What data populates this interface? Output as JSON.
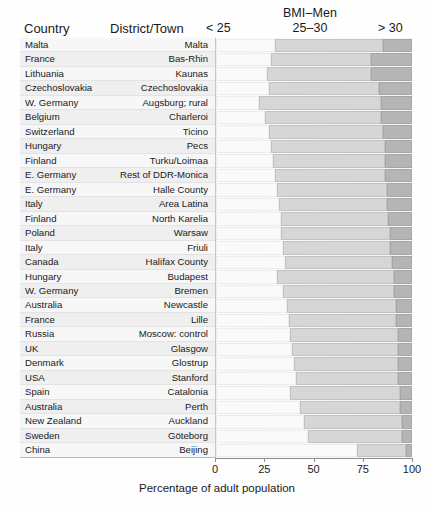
{
  "header": {
    "group_title": "BMI–Men",
    "col_country": "Country",
    "col_district": "District/Town",
    "cat_low": "< 25",
    "cat_mid": "25–30",
    "cat_high": "> 30"
  },
  "axis": {
    "xlabel": "Percentage of adult population",
    "ticks": [
      "0",
      "25",
      "50",
      "75",
      "100"
    ],
    "tick_values": [
      0,
      25,
      50,
      75,
      100
    ],
    "xlim": [
      0,
      100
    ]
  },
  "colors": {
    "low": "#fafafa",
    "mid": "#d6d6d6",
    "high": "#b5b5b5",
    "frame": "#b9b9b9",
    "axis": "#8d8d8d",
    "text": "#1a1a1a"
  },
  "chart_data": {
    "type": "bar",
    "orientation": "horizontal",
    "stacked": true,
    "title": "BMI–Men",
    "xlabel": "Percentage of adult population",
    "ylabel": "",
    "xlim": [
      0,
      100
    ],
    "grid": false,
    "legend_position": "top",
    "legend": [
      "< 25",
      "25–30",
      "> 30"
    ],
    "categories": [
      "Malta",
      "Bas-Rhin",
      "Kaunas",
      "Czechoslovakia",
      "Augsburg; rural",
      "Charleroi",
      "Ticino",
      "Pecs",
      "Turku/Loimaa",
      "Rest of DDR-Monica",
      "Halle County",
      "Area Latina",
      "North Karelia",
      "Warsaw",
      "Friuli",
      "Halifax County",
      "Budapest",
      "Bremen",
      "Newcastle",
      "Lille",
      "Moscow: control",
      "Glasgow",
      "Glostrup",
      "Stanford",
      "Catalonia",
      "Perth",
      "Auckland",
      "Göteborg",
      "Beijing"
    ],
    "series": [
      {
        "name": "< 25",
        "values": [
          30,
          28,
          26,
          27,
          22,
          25,
          27,
          28,
          29,
          30,
          31,
          32,
          33,
          33,
          34,
          35,
          31,
          34,
          36,
          37,
          38,
          39,
          40,
          41,
          38,
          43,
          45,
          47,
          72
        ]
      },
      {
        "name": "25–30",
        "values": [
          55,
          51,
          53,
          56,
          62,
          59,
          58,
          58,
          57,
          56,
          56,
          55,
          55,
          56,
          55,
          55,
          60,
          57,
          56,
          55,
          55,
          54,
          53,
          52,
          56,
          51,
          50,
          48,
          25
        ]
      },
      {
        "name": "> 30",
        "values": [
          15,
          21,
          21,
          17,
          16,
          16,
          15,
          14,
          14,
          14,
          13,
          13,
          12,
          11,
          11,
          10,
          9,
          9,
          8,
          8,
          7,
          7,
          7,
          7,
          6,
          6,
          5,
          5,
          3
        ]
      }
    ]
  },
  "rows": [
    {
      "country": "Malta",
      "district": "Malta",
      "low": 30,
      "mid": 55,
      "high": 15
    },
    {
      "country": "France",
      "district": "Bas-Rhin",
      "low": 28,
      "mid": 51,
      "high": 21
    },
    {
      "country": "Lithuania",
      "district": "Kaunas",
      "low": 26,
      "mid": 53,
      "high": 21
    },
    {
      "country": "Czechoslovakia",
      "district": "Czechoslovakia",
      "low": 27,
      "mid": 56,
      "high": 17
    },
    {
      "country": "W. Germany",
      "district": "Augsburg; rural",
      "low": 22,
      "mid": 62,
      "high": 16
    },
    {
      "country": "Belgium",
      "district": "Charleroi",
      "low": 25,
      "mid": 59,
      "high": 16
    },
    {
      "country": "Switzerland",
      "district": "Ticino",
      "low": 27,
      "mid": 58,
      "high": 15
    },
    {
      "country": "Hungary",
      "district": "Pecs",
      "low": 28,
      "mid": 58,
      "high": 14
    },
    {
      "country": "Finland",
      "district": "Turku/Loimaa",
      "low": 29,
      "mid": 57,
      "high": 14
    },
    {
      "country": "E. Germany",
      "district": "Rest of DDR-Monica",
      "low": 30,
      "mid": 56,
      "high": 14
    },
    {
      "country": "E. Germany",
      "district": "Halle County",
      "low": 31,
      "mid": 56,
      "high": 13
    },
    {
      "country": "Italy",
      "district": "Area Latina",
      "low": 32,
      "mid": 55,
      "high": 13
    },
    {
      "country": "Finland",
      "district": "North Karelia",
      "low": 33,
      "mid": 55,
      "high": 12
    },
    {
      "country": "Poland",
      "district": "Warsaw",
      "low": 33,
      "mid": 56,
      "high": 11
    },
    {
      "country": "Italy",
      "district": "Friuli",
      "low": 34,
      "mid": 55,
      "high": 11
    },
    {
      "country": "Canada",
      "district": "Halifax County",
      "low": 35,
      "mid": 55,
      "high": 10
    },
    {
      "country": "Hungary",
      "district": "Budapest",
      "low": 31,
      "mid": 60,
      "high": 9
    },
    {
      "country": "W. Germany",
      "district": "Bremen",
      "low": 34,
      "mid": 57,
      "high": 9
    },
    {
      "country": "Australia",
      "district": "Newcastle",
      "low": 36,
      "mid": 56,
      "high": 8
    },
    {
      "country": "France",
      "district": "Lille",
      "low": 37,
      "mid": 55,
      "high": 8
    },
    {
      "country": "Russia",
      "district": "Moscow: control",
      "low": 38,
      "mid": 55,
      "high": 7
    },
    {
      "country": "UK",
      "district": "Glasgow",
      "low": 39,
      "mid": 54,
      "high": 7
    },
    {
      "country": "Denmark",
      "district": "Glostrup",
      "low": 40,
      "mid": 53,
      "high": 7
    },
    {
      "country": "USA",
      "district": "Stanford",
      "low": 41,
      "mid": 52,
      "high": 7
    },
    {
      "country": "Spain",
      "district": "Catalonia",
      "low": 38,
      "mid": 56,
      "high": 6
    },
    {
      "country": "Australia",
      "district": "Perth",
      "low": 43,
      "mid": 51,
      "high": 6
    },
    {
      "country": "New Zealand",
      "district": "Auckland",
      "low": 45,
      "mid": 50,
      "high": 5
    },
    {
      "country": "Sweden",
      "district": "Göteborg",
      "low": 47,
      "mid": 48,
      "high": 5
    },
    {
      "country": "China",
      "district": "Beijing",
      "low": 72,
      "mid": 25,
      "high": 3
    }
  ]
}
